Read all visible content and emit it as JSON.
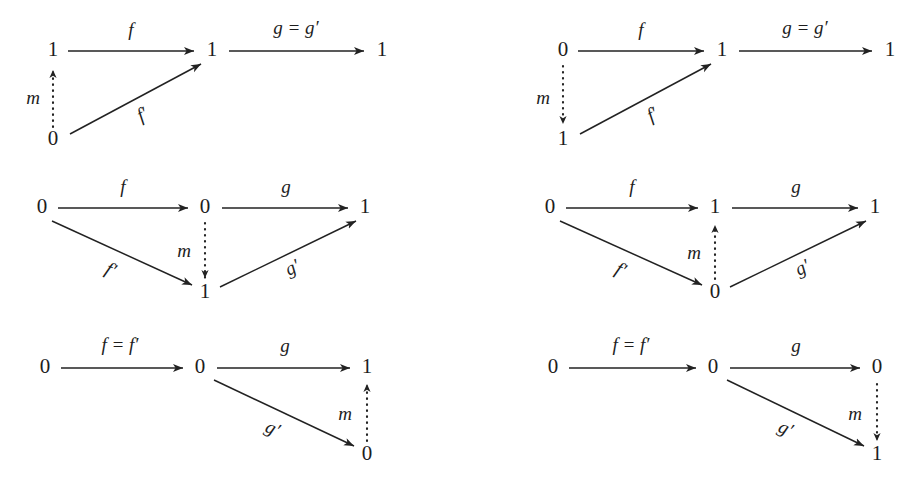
{
  "figure": {
    "background_color": "#ffffff",
    "ink_color": "#1d1d1d"
  },
  "diagrams": [
    {
      "id": "diagram-top-left",
      "nodes": {
        "left_top": "1",
        "middle_top": "1",
        "right_top": "1",
        "left_bottom": "0"
      },
      "labels": {
        "f": "f",
        "g": "g = g′",
        "f_prime": "f′",
        "m": "m"
      },
      "m_direction": "up"
    },
    {
      "id": "diagram-top-right",
      "nodes": {
        "left_top": "0",
        "middle_top": "1",
        "right_top": "1",
        "left_bottom": "1"
      },
      "labels": {
        "f": "f",
        "g": "g = g′",
        "f_prime": "f′",
        "m": "m"
      },
      "m_direction": "down"
    },
    {
      "id": "diagram-middle-left",
      "nodes": {
        "left_top": "0",
        "middle_top": "0",
        "right_top": "1",
        "middle_bottom": "1"
      },
      "labels": {
        "f": "f",
        "g": "g",
        "f_prime": "f′",
        "g_prime": "g′",
        "m": "m"
      },
      "m_direction": "down"
    },
    {
      "id": "diagram-middle-right",
      "nodes": {
        "left_top": "0",
        "middle_top": "1",
        "right_top": "1",
        "middle_bottom": "0"
      },
      "labels": {
        "f": "f",
        "g": "g",
        "f_prime": "f′",
        "g_prime": "g′",
        "m": "m"
      },
      "m_direction": "up"
    },
    {
      "id": "diagram-bottom-left",
      "nodes": {
        "left_top": "0",
        "middle_top": "0",
        "right_top": "1",
        "right_bottom": "0"
      },
      "labels": {
        "f": "f = f′",
        "g": "g",
        "g_prime": "g′",
        "m": "m"
      },
      "m_direction": "up"
    },
    {
      "id": "diagram-bottom-right",
      "nodes": {
        "left_top": "0",
        "middle_top": "0",
        "right_top": "0",
        "right_bottom": "1"
      },
      "labels": {
        "f": "f = f′",
        "g": "g",
        "g_prime": "g′",
        "m": "m"
      },
      "m_direction": "down"
    }
  ]
}
